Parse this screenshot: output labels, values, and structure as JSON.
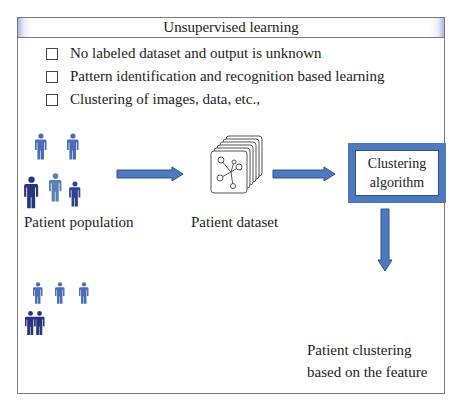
{
  "header": {
    "title": "Unsupervised learning"
  },
  "bullets": [
    "No labeled dataset and output is unknown",
    "Pattern identification and recognition based learning",
    "Clustering of images, data, etc.,"
  ],
  "flow": {
    "population_label": "Patient population",
    "dataset_label": "Patient dataset",
    "algorithm_label_line1": "Clustering",
    "algorithm_label_line2": "algorithm",
    "result_label_line1": "Patient clustering",
    "result_label_line2": "based on the feature"
  },
  "icons": {
    "person": "person-icon",
    "dataset": "dataset-stack-icon",
    "arrow_right": "arrow-right-icon",
    "arrow_down": "arrow-down-icon"
  },
  "colors": {
    "arrow_fill": "#4f79bd",
    "arrow_stroke": "#2f528f",
    "person_light": "#4a6db5",
    "person_dark": "#27357e",
    "person_mid": "#5b7fb9",
    "header_accent": "#aab7e6"
  }
}
